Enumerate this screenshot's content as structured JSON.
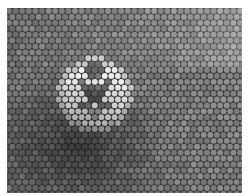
{
  "image": {
    "description": "Grayscale micrograph of hexagonally close-packed circular particles with a brighter cross-shaped cluster in the center",
    "colors": {
      "background": "#ffffff",
      "gaps": "#3a3a3a",
      "dot_base": "#8a8a8a",
      "dot_bright": "#e6e6e6",
      "shadow": "#2a2a2a"
    },
    "grid": {
      "spacing_x": 6.6,
      "spacing_y": 5.9,
      "dot_radius": 2.9
    },
    "bright_cluster": {
      "center_x": 95,
      "center_y": 95,
      "shape": "cross"
    }
  }
}
